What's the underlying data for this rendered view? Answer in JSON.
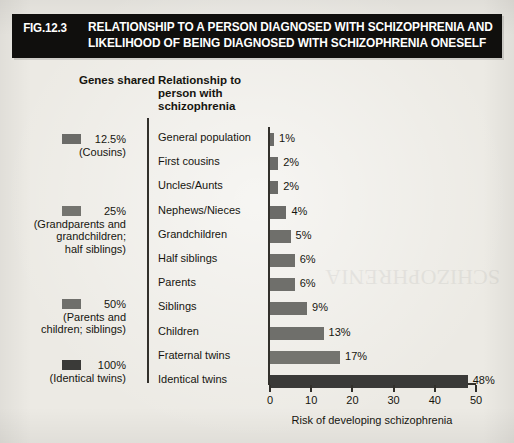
{
  "figure": {
    "number": "FIG.12.3",
    "title_line1": "RELATIONSHIP TO A PERSON DIAGNOSED WITH SCHIZOPHRENIA AND",
    "title_line2": "LIKELIHOOD OF BEING DIAGNOSED WITH SCHIZOPHRENIA ONESELF",
    "background_color": "#eceae4",
    "banner_color": "#100f0d",
    "banner_text_color": "#ffffff"
  },
  "columns": {
    "genes_shared_heading": "Genes shared",
    "relationship_heading_line1": "Relationship to",
    "relationship_heading_line2": "person with",
    "relationship_heading_line3": "schizophrenia"
  },
  "genes_groups": [
    {
      "percent": "12.5%",
      "sub_line1": "(Cousins)",
      "sub_line2": "",
      "sub_line3": "",
      "swatch_color": "#6b6b68",
      "top": 133
    },
    {
      "percent": "25%",
      "sub_line1": "(Grandparents and",
      "sub_line2": "grandchildren;",
      "sub_line3": "half siblings)",
      "swatch_color": "#74746f",
      "top": 205
    },
    {
      "percent": "50%",
      "sub_line1": "(Parents and",
      "sub_line2": "children; siblings)",
      "sub_line3": "",
      "swatch_color": "#6f6f6b",
      "top": 298
    },
    {
      "percent": "100%",
      "sub_line1": "(Identical twins)",
      "sub_line2": "",
      "sub_line3": "",
      "swatch_color": "#3a3a38",
      "top": 359
    }
  ],
  "chart_data": {
    "type": "bar",
    "orientation": "horizontal",
    "title": "RELATIONSHIP TO A PERSON DIAGNOSED WITH SCHIZOPHRENIA AND LIKELIHOOD OF BEING DIAGNOSED WITH SCHIZOPHRENIA ONESELF",
    "xlabel": "Risk of developing schizophrenia",
    "ylabel": "Relationship to person with schizophrenia",
    "xlim": [
      0,
      50
    ],
    "xticks": [
      0,
      10,
      20,
      30,
      40,
      50
    ],
    "grid": false,
    "legend": false,
    "categories": [
      "General population",
      "First cousins",
      "Uncles/Aunts",
      "Nephews/Nieces",
      "Grandchildren",
      "Half siblings",
      "Parents",
      "Siblings",
      "Children",
      "Fraternal twins",
      "Identical twins"
    ],
    "values": [
      1,
      2,
      2,
      4,
      5,
      6,
      6,
      9,
      13,
      17,
      48
    ],
    "value_labels": [
      "1%",
      "2%",
      "2%",
      "4%",
      "5%",
      "6%",
      "6%",
      "9%",
      "13%",
      "17%",
      "48%"
    ],
    "bar_colors": [
      "#6b6b68",
      "#6b6b68",
      "#6b6b68",
      "#6b6b68",
      "#6f6f6b",
      "#6f6f6b",
      "#6f6f6b",
      "#6f6f6b",
      "#6f6f6b",
      "#74746f",
      "#3a3a38"
    ]
  },
  "watermark": "SCHIZOPHRENIA"
}
